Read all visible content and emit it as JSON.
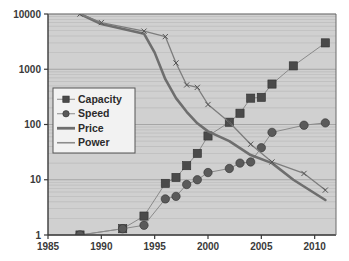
{
  "chart_data": {
    "type": "line",
    "title": "",
    "xlabel": "",
    "ylabel": "",
    "xlim": [
      1985,
      2012
    ],
    "ylim": [
      1,
      10000
    ],
    "yscale": "log",
    "xscale": "linear",
    "grid": true,
    "grid_axis": "y",
    "grid_minor": true,
    "legend_position": "center-left",
    "xticks": [
      "1985",
      "1990",
      "1995",
      "2000",
      "2005",
      "2010"
    ],
    "xtick_values": [
      1985,
      1990,
      1995,
      2000,
      2005,
      2010
    ],
    "yticks": [
      "1",
      "10",
      "100",
      "1000",
      "10000"
    ],
    "ytick_values": [
      1,
      10,
      100,
      1000,
      10000
    ],
    "series": [
      {
        "name": "Capacity",
        "marker": "square",
        "color": "#4a4a4a",
        "line_color": "#8a8a8a",
        "x": [
          1988,
          1992,
          1994,
          1996,
          1997,
          1998,
          1999,
          2000,
          2002,
          2003,
          2004,
          2005,
          2006,
          2008,
          2011
        ],
        "values": [
          1,
          1.3,
          2.2,
          8.6,
          11,
          18,
          30,
          62,
          110,
          160,
          300,
          310,
          540,
          1150,
          3000
        ]
      },
      {
        "name": "Speed",
        "marker": "circle",
        "color": "#5a5a5a",
        "line_color": "#8a8a8a",
        "x": [
          1988,
          1992,
          1994,
          1996,
          1997,
          1998,
          1999,
          2000,
          2002,
          2003,
          2004,
          2005,
          2006,
          2009,
          2011
        ],
        "values": [
          1,
          1.3,
          1.5,
          4.5,
          5.0,
          8.2,
          10,
          13.5,
          16,
          20,
          21,
          38,
          72,
          97,
          107
        ]
      },
      {
        "name": "Price",
        "marker": "none",
        "color": "#6e6e6e",
        "line_width": 2.6,
        "x": [
          1988,
          1990,
          1994,
          1995,
          1996,
          1997,
          1998,
          1999,
          2000,
          2002,
          2004,
          2006,
          2008,
          2011
        ],
        "values": [
          10000,
          6600,
          4400,
          2000,
          660,
          300,
          170,
          105,
          75,
          50,
          28,
          20,
          10,
          4.3
        ]
      },
      {
        "name": "Power",
        "marker": "x",
        "color": "#7d7d7d",
        "line_width": 1.3,
        "x": [
          1988,
          1990,
          1994,
          1996,
          1997,
          1998,
          1999,
          2000,
          2002,
          2004,
          2006,
          2009,
          2011
        ],
        "values": [
          10000,
          7000,
          4900,
          3900,
          1300,
          520,
          470,
          230,
          110,
          44,
          21,
          13,
          6.5
        ]
      }
    ],
    "legend_entries": [
      {
        "label": "Capacity",
        "marker": "square"
      },
      {
        "label": "Speed",
        "marker": "circle"
      },
      {
        "label": "Price",
        "marker": "thick-line"
      },
      {
        "label": "Power",
        "marker": "thin-line"
      }
    ],
    "colors": {
      "plot_background": "#d0d0d0",
      "gridline": "#b0b0b0",
      "axis": "#3a3a3a",
      "legend_background": "#f2f2f2",
      "legend_border": "#555555"
    }
  }
}
